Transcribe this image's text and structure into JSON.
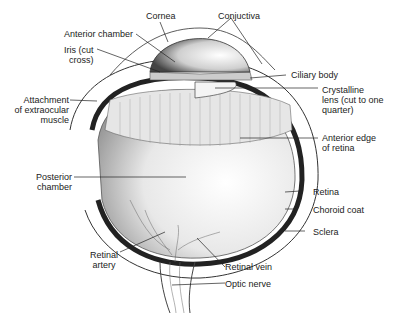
{
  "labels": {
    "cornea": "Cornea",
    "conjuctiva": "Conjuctiva",
    "anterior_chamber": "Anterior chamber",
    "iris": "Iris (cut\n  cross)",
    "ciliary_body": "Ciliary body",
    "crystalline_lens": "Crystalline\nlens (cut to one\nquarter)",
    "attachment": "Attachment\nof extraocular\nmuscle",
    "anterior_edge": "Anterior edge\nof retina",
    "posterior_chamber": "Posterior\nchamber",
    "retina": "Retina",
    "choroid_coat": "Choroid coat",
    "sclera": "Sclera",
    "retinal_artery": "Retinal\n artery",
    "retinal_vein": "Retinal vein",
    "optic_nerve": "Optic nerve"
  }
}
